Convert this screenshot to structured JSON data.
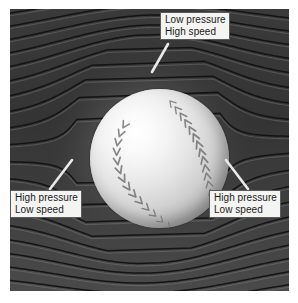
{
  "figure": {
    "name": "baseball-airflow-diagram",
    "background_color": "#2f2f2f",
    "plate": {
      "x": 10,
      "y": 9,
      "width": 279,
      "height": 282
    },
    "ball": {
      "center_x": 149,
      "center_y": 149,
      "radius": 69
    }
  },
  "callouts": {
    "top": {
      "name": "low-pressure-high-speed",
      "line1": "Low pressure",
      "line2": "High speed",
      "box_color": "#f4f4f2",
      "border_color": "#5a5a5a"
    },
    "left": {
      "name": "high-pressure-low-speed-left",
      "line1": "High pressure",
      "line2": "Low speed",
      "box_color": "#f4f4f2",
      "border_color": "#5a5a5a"
    },
    "right": {
      "name": "high-pressure-low-speed-right",
      "line1": "High pressure",
      "line2": "Low speed",
      "box_color": "#f4f4f2",
      "border_color": "#5a5a5a"
    }
  },
  "leaders": {
    "top": {
      "x1": 168,
      "y1": 44,
      "x2": 152,
      "y2": 72,
      "color": "#e9e9e9"
    },
    "left": {
      "x1": 50,
      "y1": 189,
      "x2": 72,
      "y2": 160,
      "color": "#e9e9e9"
    },
    "right": {
      "x1": 248,
      "y1": 189,
      "x2": 226,
      "y2": 160,
      "color": "#e9e9e9"
    }
  },
  "streamlines": {
    "count": 34,
    "color": "#101010",
    "highlight_color": "#9a9a9a",
    "direction": "left-to-right",
    "description": "streamlines compress over and under the ball"
  },
  "seams": {
    "color": "#6d6d6d",
    "stitch_count_left": 14,
    "stitch_count_right": 16
  }
}
